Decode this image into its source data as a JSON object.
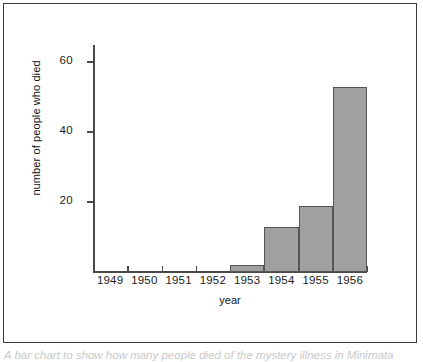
{
  "figure": {
    "caption": "A bar chart to show how many people died of the mystery illness in Minimata",
    "frame_color": "#3a3a3a"
  },
  "chart_data": {
    "type": "bar",
    "title": "",
    "subtitle": "",
    "xlabel": "year",
    "ylabel": "number of people who died",
    "categories": [
      "1949",
      "1950",
      "1951",
      "1952",
      "1953",
      "1954",
      "1955",
      "1956"
    ],
    "values": [
      0,
      0,
      0,
      0,
      2,
      13,
      19,
      53
    ],
    "ylim": [
      0,
      62
    ],
    "ytick_values": [
      20,
      40,
      60
    ],
    "ytick_labels": [
      "20",
      "40",
      "60"
    ],
    "grid": false,
    "legend": null,
    "bar_fill_color": "#a0a0a0",
    "bar_edge_color": "#555555",
    "axis_color": "#4a4a4a",
    "series": [
      {
        "name": "number of people who died",
        "values": [
          0,
          0,
          0,
          0,
          2,
          13,
          19,
          53
        ]
      }
    ],
    "annotations": []
  }
}
